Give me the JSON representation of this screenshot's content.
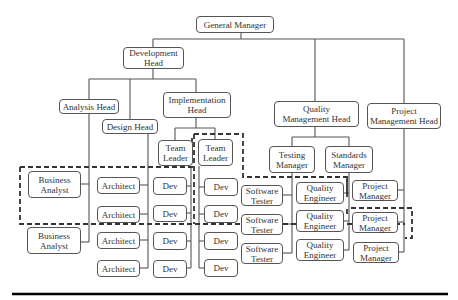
{
  "diagram": {
    "type": "org-chart",
    "nodes": [
      {
        "id": "gm",
        "label": "General Manager",
        "x": 196,
        "y": 16,
        "w": 78,
        "h": 17
      },
      {
        "id": "devhead",
        "label": "Development\nHead",
        "x": 123,
        "y": 47,
        "w": 61,
        "h": 22
      },
      {
        "id": "analysis",
        "label": "Analysis Head",
        "x": 59,
        "y": 99,
        "w": 60,
        "h": 15
      },
      {
        "id": "design",
        "label": "Design Head",
        "x": 102,
        "y": 119,
        "w": 56,
        "h": 15
      },
      {
        "id": "impl",
        "label": "Implementation\nHead",
        "x": 163,
        "y": 92,
        "w": 68,
        "h": 26
      },
      {
        "id": "qmh",
        "label": "Quality\nManagement Head",
        "x": 274,
        "y": 101,
        "w": 85,
        "h": 26
      },
      {
        "id": "pmh",
        "label": "Project\nManagement Head",
        "x": 367,
        "y": 103,
        "w": 74,
        "h": 26
      },
      {
        "id": "tl1",
        "label": "Team\nLeader",
        "x": 158,
        "y": 140,
        "w": 35,
        "h": 26
      },
      {
        "id": "tl2",
        "label": "Team\nLeader",
        "x": 198,
        "y": 139,
        "w": 35,
        "h": 27
      },
      {
        "id": "tm",
        "label": "Testing\nManager",
        "x": 269,
        "y": 146,
        "w": 46,
        "h": 27
      },
      {
        "id": "sm",
        "label": "Standards\nManager",
        "x": 325,
        "y": 146,
        "w": 48,
        "h": 27
      },
      {
        "id": "ba1",
        "label": "Business\nAnalyst",
        "x": 28,
        "y": 171,
        "w": 53,
        "h": 27
      },
      {
        "id": "ba2",
        "label": "Business\nAnalyst",
        "x": 27,
        "y": 227,
        "w": 54,
        "h": 27
      },
      {
        "id": "ar1",
        "label": "Architect",
        "x": 97,
        "y": 177,
        "w": 43,
        "h": 17
      },
      {
        "id": "ar2",
        "label": "Architect",
        "x": 97,
        "y": 206,
        "w": 43,
        "h": 17
      },
      {
        "id": "ar3",
        "label": "Architect",
        "x": 97,
        "y": 232,
        "w": 43,
        "h": 17
      },
      {
        "id": "ar4",
        "label": "Architect",
        "x": 97,
        "y": 260,
        "w": 43,
        "h": 17
      },
      {
        "id": "d1",
        "label": "Dev",
        "x": 153,
        "y": 177,
        "w": 34,
        "h": 18
      },
      {
        "id": "d2",
        "label": "Dev",
        "x": 153,
        "y": 205,
        "w": 34,
        "h": 17
      },
      {
        "id": "d3",
        "label": "Dev",
        "x": 153,
        "y": 232,
        "w": 34,
        "h": 18
      },
      {
        "id": "d4",
        "label": "Dev",
        "x": 153,
        "y": 260,
        "w": 34,
        "h": 18
      },
      {
        "id": "d5",
        "label": "Dev",
        "x": 204,
        "y": 178,
        "w": 34,
        "h": 18
      },
      {
        "id": "d6",
        "label": "Dev",
        "x": 204,
        "y": 205,
        "w": 34,
        "h": 18
      },
      {
        "id": "d7",
        "label": "Dev",
        "x": 204,
        "y": 232,
        "w": 34,
        "h": 18
      },
      {
        "id": "d8",
        "label": "Dev",
        "x": 204,
        "y": 259,
        "w": 34,
        "h": 18
      },
      {
        "id": "st1",
        "label": "Software\nTester",
        "x": 241,
        "y": 185,
        "w": 42,
        "h": 21
      },
      {
        "id": "st2",
        "label": "Software\nTester",
        "x": 241,
        "y": 214,
        "w": 42,
        "h": 21
      },
      {
        "id": "st3",
        "label": "Software\nTester",
        "x": 241,
        "y": 243,
        "w": 42,
        "h": 21
      },
      {
        "id": "qe1",
        "label": "Quality\nEngineer",
        "x": 296,
        "y": 182,
        "w": 48,
        "h": 22
      },
      {
        "id": "qe2",
        "label": "Quality\nEngineer",
        "x": 296,
        "y": 210,
        "w": 48,
        "h": 22
      },
      {
        "id": "qe3",
        "label": "Quality\nEngineer",
        "x": 296,
        "y": 239,
        "w": 48,
        "h": 22
      },
      {
        "id": "pm1",
        "label": "Project\nManager",
        "x": 352,
        "y": 180,
        "w": 46,
        "h": 21
      },
      {
        "id": "pm2",
        "label": "Project\nManager",
        "x": 352,
        "y": 212,
        "w": 46,
        "h": 21
      },
      {
        "id": "pm3",
        "label": "Project\nManager",
        "x": 353,
        "y": 242,
        "w": 46,
        "h": 21
      }
    ],
    "connectors": [
      "M241,33 V39",
      "M153,39 H404",
      "M153,39 V47",
      "M315,39 V101",
      "M404,39 V103",
      "M153,69 V79",
      "M89,79 H196",
      "M89,79 V99",
      "M130,79 V119",
      "M196,79 V92",
      "M89,114 V242",
      "M81,184 H89",
      "M81,242 H89",
      "M148,134 V268",
      "M140,185 H148",
      "M140,214 H148",
      "M140,240 H148",
      "M140,268 H148",
      "M196,118 V128",
      "M175,128 H215",
      "M175,128 V140",
      "M215,128 V139",
      "M191,166 V268",
      "M187,186 H191",
      "M187,213 H191",
      "M187,241 H191",
      "M187,268 H191",
      "M199,166 V268",
      "M199,187 H204",
      "M199,214 H204",
      "M199,241 H204",
      "M199,268 H204",
      "M315,127 V137",
      "M292,137 H349",
      "M292,137 V146",
      "M349,137 V146",
      "M292,173 V253",
      "M283,195 H292",
      "M283,224 H292",
      "M283,253 H292",
      "M349,173 V250",
      "M344,193 H349",
      "M344,221 H349",
      "M344,250 H349",
      "M404,129 V252",
      "M398,190 H404",
      "M398,222 H404",
      "M399,252 H404"
    ],
    "dashed_groups": [
      "M20,167 H192 V141 M192,138 V143",
      "M20,167 V224 H405",
      "M194,134 H243 V177 H347 V193 H351",
      "M347,177 V197",
      "M351,208 H412 V238 H405",
      "M194,134 V224",
      "M347,209 V217"
    ],
    "footer_rule": {
      "x1": 12,
      "x2": 448,
      "y": 294
    }
  }
}
